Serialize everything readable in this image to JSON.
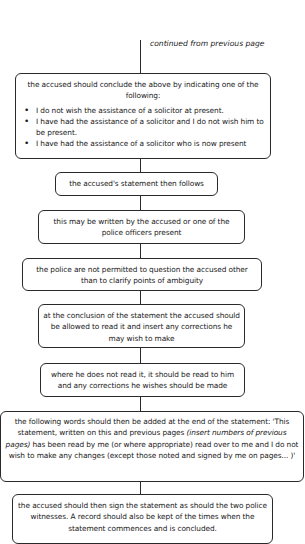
{
  "continuation_label": "continued from previous page",
  "boxes": {
    "b1": {
      "intro": "the accused should conclude the above by indicating one of the following:",
      "bullets": [
        "I do not wish the assistance of a solicitor at present.",
        "I have had the assistance of a solicitor and I do not wish him to be present.",
        "I have had the assistance of a solicitor who is now present"
      ]
    },
    "b2": "the accused's statement then follows",
    "b3": "this may be written by the accused or one of the police officers present",
    "b4": "the police are not permitted to question the accused other than to clarify points of ambiguity",
    "b5": "at the conclusion of the statement the accused should be allowed to read it and insert any corrections he may wish to make",
    "b6": "where he does not read it, it should be read to him and any corrections he wishes should be made",
    "b7": {
      "part1": "the following words should then be added at the end of the statement: 'This statement, written on this and previous pages ",
      "italic": "(insert numbers of previous pages)",
      "part2": " has been read by me (or where appropriate) read over to me and I do not wish to make any changes (except those noted and signed by me on pages... )'"
    },
    "b8": "the accused should then sign the statement as should the two police witnesses. A record should also be kept of the times when the statement commences and is concluded."
  },
  "colors": {
    "line": "#2a2a2a",
    "text": "#1a1a1a",
    "background": "#ffffff"
  }
}
